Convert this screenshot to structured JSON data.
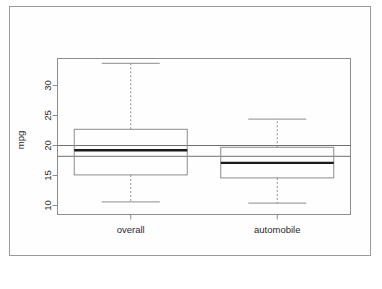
{
  "figure": {
    "background_color": "#ffffff",
    "border_color": "#9a9a9a",
    "plot_line_color": "#8c8c8c",
    "median_color": "#1a1a1a",
    "reference_line_color": "#6f6f6f"
  },
  "chart_data": {
    "type": "boxplot",
    "title": "",
    "xlabel": "",
    "ylabel": "mpg",
    "categories": [
      "overall",
      "automobile"
    ],
    "ylim": [
      8.5,
      34.5
    ],
    "yticks": [
      10,
      15,
      20,
      25,
      30
    ],
    "ytick_labels": [
      "10",
      "15",
      "20",
      "25",
      "30"
    ],
    "grid": false,
    "legend": false,
    "boxes": [
      {
        "name": "overall",
        "whisker_low": 10.6,
        "q1": 15.1,
        "median": 19.2,
        "q3": 22.7,
        "whisker_high": 33.7,
        "outliers": []
      },
      {
        "name": "automobile",
        "whisker_low": 10.4,
        "q1": 14.6,
        "median": 17.1,
        "q3": 19.7,
        "whisker_high": 24.4,
        "outliers": []
      }
    ],
    "reference_lines": [
      {
        "name": "upper-reference-line",
        "value": 20.0
      },
      {
        "name": "lower-reference-line",
        "value": 18.2
      }
    ]
  }
}
